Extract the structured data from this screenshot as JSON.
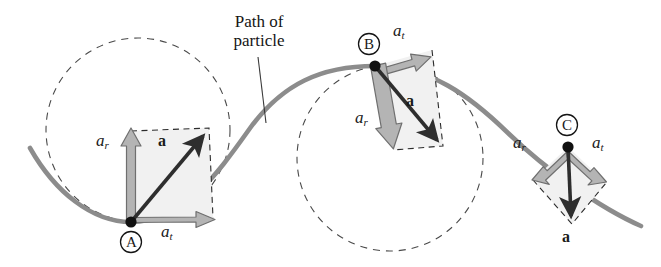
{
  "figure": {
    "background_color": "#ffffff",
    "width": 661,
    "height": 267
  },
  "annotations": {
    "path_label_line1": "Path of",
    "path_label_line2": "particle"
  },
  "colors": {
    "curve": "#8c8c8c",
    "curve_dark": "#6f6f6f",
    "dashed_circle": "#4a4a4a",
    "dashed_box": "#2b2b2b",
    "component_arrow_fill": "#b0b0b0",
    "component_arrow_stroke": "#6a6a6a",
    "resultant_arrow": "#2e2e2e",
    "parallelogram_fill": "#f1f1f1",
    "point_dot": "#111111",
    "text": "#1a1a1a"
  },
  "points": [
    {
      "id": "A",
      "label": "A",
      "position": {
        "x": 131,
        "y": 222
      },
      "description": "bottom of the valley of the path",
      "osculating_circle": {
        "cx": 138,
        "cy": 130,
        "r": 92
      },
      "vectors": [
        {
          "name": "a_r",
          "symbol": "a",
          "subscript": "r",
          "kind": "radial",
          "tip": {
            "x": 131,
            "y": 131
          },
          "label_position": {
            "x": 98,
            "y": 140
          }
        },
        {
          "name": "a_t",
          "symbol": "a",
          "subscript": "t",
          "kind": "tangential",
          "tip": {
            "x": 213,
            "y": 218
          },
          "label_position": {
            "x": 163,
            "y": 228
          }
        },
        {
          "name": "a",
          "symbol": "a",
          "subscript": "",
          "kind": "resultant",
          "tip": {
            "x": 209,
            "y": 128
          },
          "label_position": {
            "x": 160,
            "y": 137
          }
        }
      ]
    },
    {
      "id": "B",
      "label": "B",
      "position": {
        "x": 375,
        "y": 66
      },
      "description": "crest of the path",
      "osculating_circle": {
        "cx": 390,
        "cy": 158,
        "r": 93
      },
      "vectors": [
        {
          "name": "a_t",
          "symbol": "a",
          "subscript": "t",
          "kind": "tangential",
          "tip": {
            "x": 432,
            "y": 50
          },
          "label_position": {
            "x": 396,
            "y": 29
          }
        },
        {
          "name": "a_r",
          "symbol": "a",
          "subscript": "r",
          "kind": "radial",
          "tip": {
            "x": 393,
            "y": 150
          },
          "label_position": {
            "x": 358,
            "y": 117
          }
        },
        {
          "name": "a",
          "symbol": "a",
          "subscript": "",
          "kind": "resultant",
          "tip": {
            "x": 443,
            "y": 146
          },
          "label_position": {
            "x": 409,
            "y": 98
          }
        }
      ]
    },
    {
      "id": "C",
      "label": "C",
      "position": {
        "x": 568,
        "y": 147
      },
      "description": "on the descending slope of the path",
      "osculating_circle": null,
      "vectors": [
        {
          "name": "a_r",
          "symbol": "a",
          "subscript": "r",
          "kind": "radial",
          "tip": {
            "x": 533,
            "y": 180
          },
          "label_position": {
            "x": 516,
            "y": 142
          }
        },
        {
          "name": "a_t",
          "symbol": "a",
          "subscript": "t",
          "kind": "tangential",
          "tip": {
            "x": 606,
            "y": 183
          },
          "label_position": {
            "x": 596,
            "y": 142
          }
        },
        {
          "name": "a",
          "symbol": "a",
          "subscript": "",
          "kind": "resultant",
          "tip": {
            "x": 572,
            "y": 224
          },
          "label_position": {
            "x": 565,
            "y": 232
          }
        }
      ]
    }
  ],
  "path_curve": {
    "description": "Sinusoidal particle path descending from left, valley at A, crest at B, descending through C",
    "start": {
      "x": 30,
      "y": 148
    },
    "end": {
      "x": 641,
      "y": 226
    }
  },
  "leader_line": {
    "from": {
      "x": 258,
      "y": 57
    },
    "to": {
      "x": 266,
      "y": 123
    }
  }
}
